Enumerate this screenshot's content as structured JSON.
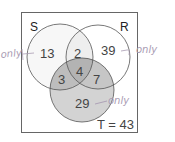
{
  "diagram": {
    "type": "venn3",
    "universe": {
      "label": "T = 43"
    },
    "sets": [
      {
        "name": "S",
        "label": "S"
      },
      {
        "name": "R",
        "label": "R"
      },
      {
        "name": "T",
        "label": "T"
      }
    ],
    "regions": {
      "S_only": "13",
      "S_and_R_only": "2",
      "R_only": "39",
      "S_and_T_only": "3",
      "S_R_T": "4",
      "R_and_T_only": "7",
      "T_only": "29"
    },
    "annotations": {
      "left": "only",
      "right": "only",
      "bottom": "only"
    },
    "colors": {
      "border": "#666666",
      "circle_stroke": "#555555",
      "s_fill": "#f7f7f7",
      "sr_fill": "#eeeeee",
      "t_fill": "#d3d3d3",
      "triple_fill": "#b8b8b8",
      "st_fill": "#bdbdbd",
      "rt_fill": "#c6c6c6",
      "handwriting": "#a99cb3"
    }
  }
}
